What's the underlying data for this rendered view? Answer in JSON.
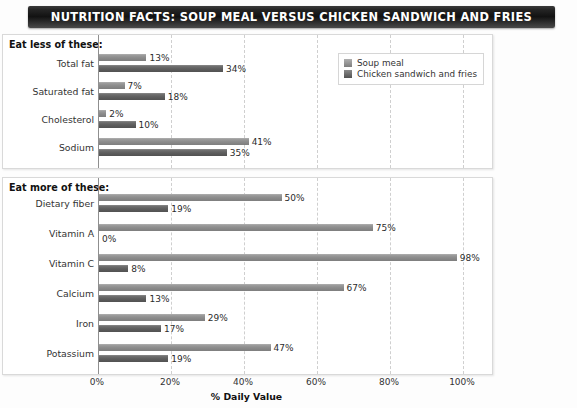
{
  "title": "NUTRITION FACTS:  SOUP MEAL VERSUS CHICKEN SANDWICH AND FRIES",
  "legend": {
    "series1": "Soup meal",
    "series2": "Chicken sandwich and fries"
  },
  "sections": {
    "top_heading": "Eat less of these:",
    "bottom_heading": "Eat more of these:"
  },
  "axis": {
    "xlabel": "% Daily Value",
    "ticks": [
      "0%",
      "20%",
      "40%",
      "60%",
      "80%",
      "100%"
    ]
  },
  "colors": {
    "series1": "#8b8b8b",
    "series2": "#5e5e5e",
    "title_bar": "#121212",
    "grid": "#cfcfcf",
    "panel_border": "#d9d9d9"
  },
  "chart_data": [
    {
      "type": "bar",
      "title": "Eat less of these:",
      "orientation": "horizontal",
      "xlabel": "% Daily Value",
      "ylabel": "",
      "xlim": [
        0,
        100
      ],
      "grid": true,
      "legend_position": "top-right",
      "categories": [
        "Total fat",
        "Saturated fat",
        "Cholesterol",
        "Sodium"
      ],
      "series": [
        {
          "name": "Soup meal",
          "values": [
            13,
            7,
            2,
            41
          ],
          "labels": [
            "13%",
            "7%",
            "2%",
            "41%"
          ]
        },
        {
          "name": "Chicken sandwich and fries",
          "values": [
            34,
            18,
            10,
            35
          ],
          "labels": [
            "34%",
            "18%",
            "10%",
            "35%"
          ]
        }
      ]
    },
    {
      "type": "bar",
      "title": "Eat more of these:",
      "orientation": "horizontal",
      "xlabel": "% Daily Value",
      "ylabel": "",
      "xlim": [
        0,
        100
      ],
      "grid": true,
      "legend_position": "none",
      "categories": [
        "Dietary fiber",
        "Vitamin A",
        "Vitamin C",
        "Calcium",
        "Iron",
        "Potassium"
      ],
      "series": [
        {
          "name": "Soup meal",
          "values": [
            50,
            75,
            98,
            67,
            29,
            47
          ],
          "labels": [
            "50%",
            "75%",
            "98%",
            "67%",
            "29%",
            "47%"
          ]
        },
        {
          "name": "Chicken sandwich and fries",
          "values": [
            19,
            0,
            8,
            13,
            17,
            19
          ],
          "labels": [
            "19%",
            "0%",
            "8%",
            "13%",
            "17%",
            "19%"
          ]
        }
      ]
    }
  ]
}
